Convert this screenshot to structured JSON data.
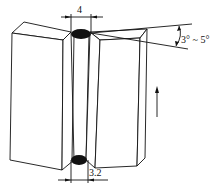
{
  "diagram": {
    "labels": {
      "top_gap": "4",
      "bottom_gap": "3.2",
      "angle": "3° ~ 5°"
    },
    "colors": {
      "line": "#111111",
      "weld": "#111111",
      "background": "#ffffff"
    }
  }
}
